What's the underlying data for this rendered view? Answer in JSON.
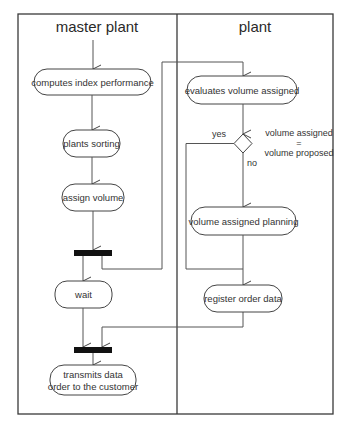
{
  "diagram": {
    "type": "UML activity diagram with swimlanes",
    "lanes": [
      {
        "id": "master",
        "title": "master plant"
      },
      {
        "id": "plant",
        "title": "plant"
      }
    ],
    "nodes": {
      "computes_index": {
        "label": "computes index performance",
        "lane": "master"
      },
      "plants_sorting": {
        "label": "plants sorting",
        "lane": "master"
      },
      "assign_volume": {
        "label": "assign volume",
        "lane": "master"
      },
      "fork": {
        "label": "",
        "kind": "fork-bar",
        "lane": "master"
      },
      "wait": {
        "label": "wait",
        "lane": "master"
      },
      "join": {
        "label": "",
        "kind": "join-bar",
        "lane": "master"
      },
      "transmits_line1": {
        "label": "transmits data"
      },
      "transmits_line2": {
        "label": "order to the customer"
      },
      "evaluates": {
        "label": "evaluates volume assigned",
        "lane": "plant"
      },
      "decision": {
        "label": "",
        "kind": "decision",
        "lane": "plant"
      },
      "condition_line1": {
        "label": "volume assigned"
      },
      "condition_line2": {
        "label": "="
      },
      "condition_line3": {
        "label": "volume proposed"
      },
      "yes_label": {
        "label": "yes"
      },
      "no_label": {
        "label": "no"
      },
      "planning": {
        "label": "volume assigned planning",
        "lane": "plant"
      },
      "register": {
        "label": "register order data",
        "lane": "plant"
      }
    },
    "edges": [
      {
        "from": "start",
        "to": "computes_index"
      },
      {
        "from": "computes_index",
        "to": "plants_sorting"
      },
      {
        "from": "plants_sorting",
        "to": "assign_volume"
      },
      {
        "from": "assign_volume",
        "to": "fork"
      },
      {
        "from": "fork",
        "to": "wait"
      },
      {
        "from": "fork",
        "to": "evaluates"
      },
      {
        "from": "evaluates",
        "to": "decision"
      },
      {
        "from": "decision",
        "to": "planning",
        "label": "no"
      },
      {
        "from": "decision",
        "to": "register",
        "label": "yes"
      },
      {
        "from": "planning",
        "to": "register"
      },
      {
        "from": "wait",
        "to": "join"
      },
      {
        "from": "register",
        "to": "join"
      },
      {
        "from": "join",
        "to": "transmits"
      }
    ]
  }
}
